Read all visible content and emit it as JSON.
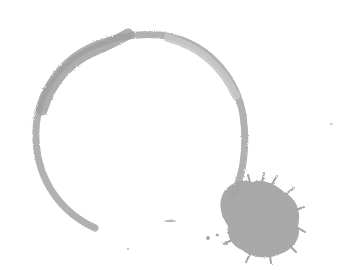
{
  "image": {
    "subject": "coffee ring stain with splatter",
    "background_color": "#ffffff",
    "stain_color": "#a6a6a6",
    "stain_dark_color": "#9a9a9a",
    "stain_light_color": "#c8c8c8"
  }
}
